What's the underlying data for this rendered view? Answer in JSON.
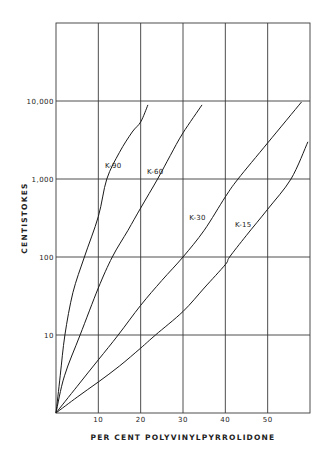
{
  "chart_data": {
    "type": "line",
    "title": "",
    "xlabel": "PER CENT POLYVINYLPYRROLIDONE",
    "ylabel": "CENTISTOKES",
    "xlim": [
      0,
      60
    ],
    "ylim": [
      1,
      100000
    ],
    "yscale": "log",
    "grid": true,
    "legend_position": "inline labels",
    "x_ticks": [
      {
        "value": 10,
        "label": "10"
      },
      {
        "value": 20,
        "label": "20"
      },
      {
        "value": 30,
        "label": "30"
      },
      {
        "value": 40,
        "label": "40"
      },
      {
        "value": 50,
        "label": "50"
      }
    ],
    "y_ticks": [
      {
        "value": 10,
        "label": "10"
      },
      {
        "value": 100,
        "label": "100"
      },
      {
        "value": 1000,
        "label": "1,000"
      },
      {
        "value": 10000,
        "label": "10,000"
      }
    ],
    "series": [
      {
        "name": "K-90",
        "label_pos": {
          "x": 11.6,
          "y": 1400
        },
        "points": [
          [
            0,
            1
          ],
          [
            1,
            3
          ],
          [
            2.1,
            10
          ],
          [
            4,
            35
          ],
          [
            6.7,
            100
          ],
          [
            10,
            330
          ],
          [
            12,
            1000
          ],
          [
            15,
            2200
          ],
          [
            18,
            4000
          ],
          [
            20,
            5400
          ],
          [
            21.7,
            8900
          ]
        ]
      },
      {
        "name": "K-60",
        "label_pos": {
          "x": 21.5,
          "y": 1150
        },
        "points": [
          [
            0,
            1
          ],
          [
            2,
            3
          ],
          [
            5.7,
            10
          ],
          [
            10,
            40
          ],
          [
            13.3,
            100
          ],
          [
            17,
            220
          ],
          [
            20,
            425
          ],
          [
            24,
            1000
          ],
          [
            27,
            2000
          ],
          [
            30,
            3900
          ],
          [
            34.5,
            8900
          ]
        ]
      },
      {
        "name": "K-30",
        "label_pos": {
          "x": 31.5,
          "y": 300
        },
        "points": [
          [
            0,
            1
          ],
          [
            5,
            2.2
          ],
          [
            10,
            4.8
          ],
          [
            14.7,
            10
          ],
          [
            20,
            24
          ],
          [
            25,
            50
          ],
          [
            30,
            100
          ],
          [
            35,
            220
          ],
          [
            40,
            590
          ],
          [
            43,
            1000
          ],
          [
            50,
            2900
          ],
          [
            58,
            9700
          ]
        ]
      },
      {
        "name": "K-15",
        "label_pos": {
          "x": 42.3,
          "y": 240
        },
        "points": [
          [
            0,
            1
          ],
          [
            5,
            1.6
          ],
          [
            10,
            2.5
          ],
          [
            15,
            4
          ],
          [
            20,
            6.8
          ],
          [
            23.5,
            10
          ],
          [
            30,
            20
          ],
          [
            35,
            40
          ],
          [
            40,
            80
          ],
          [
            41,
            100
          ],
          [
            45,
            190
          ],
          [
            50,
            410
          ],
          [
            55.5,
            1000
          ],
          [
            59.5,
            3000
          ]
        ]
      }
    ]
  }
}
